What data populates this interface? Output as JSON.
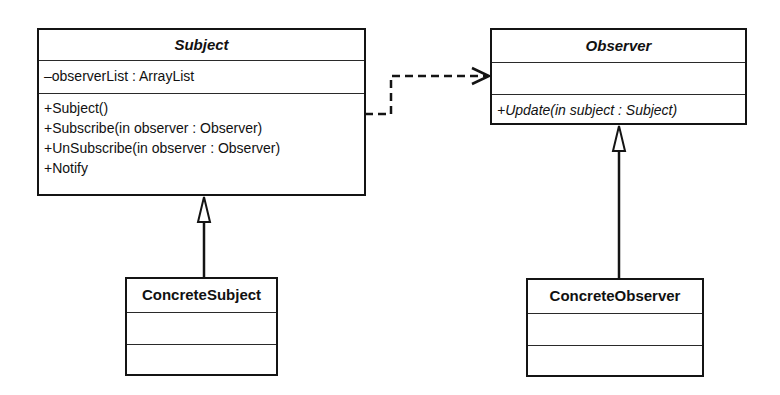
{
  "diagram": {
    "type": "UML class diagram",
    "classes": {
      "subject": {
        "name": "Subject",
        "abstract": true,
        "attributes": [
          "–observerList : ArrayList"
        ],
        "operations": [
          "+Subject()",
          "+Subscribe(in observer : Observer)",
          "+UnSubscribe(in observer : Observer)",
          "+Notify"
        ]
      },
      "observer": {
        "name": "Observer",
        "abstract": true,
        "attributes": [],
        "operations": [
          "+Update(in subject : Subject)"
        ]
      },
      "concrete_subject": {
        "name": "ConcreteSubject",
        "abstract": false,
        "attributes": [],
        "operations": []
      },
      "concrete_observer": {
        "name": "ConcreteObserver",
        "abstract": false,
        "attributes": [],
        "operations": []
      }
    },
    "relationships": [
      {
        "type": "dependency",
        "from": "Subject",
        "to": "Observer",
        "style": "dashed",
        "arrow": "open"
      },
      {
        "type": "generalization",
        "from": "ConcreteSubject",
        "to": "Subject",
        "arrow": "hollow-triangle"
      },
      {
        "type": "generalization",
        "from": "ConcreteObserver",
        "to": "Observer",
        "arrow": "hollow-triangle"
      }
    ],
    "colors": {
      "line": "#141414",
      "background": "#ffffff"
    }
  }
}
